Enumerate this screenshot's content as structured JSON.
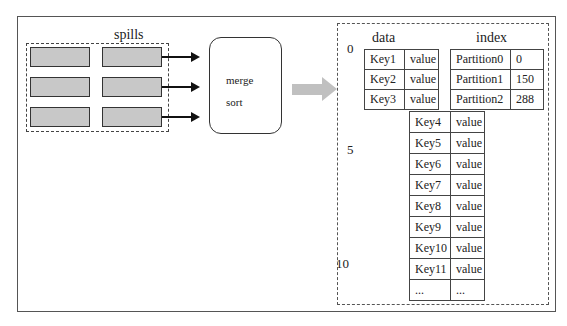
{
  "spills": {
    "label": "spills",
    "blocks": [
      [
        1,
        1
      ],
      [
        1,
        1
      ],
      [
        1,
        1
      ]
    ],
    "colors": {
      "block_fill": "#c8c8c8",
      "block_border": "#333333"
    }
  },
  "merge": {
    "line1": "merge",
    "line2": "sort"
  },
  "output": {
    "row_markers": [
      "0",
      "5",
      "10"
    ],
    "data_label": "data",
    "index_label": "index",
    "data_top": [
      [
        "Key1",
        "value"
      ],
      [
        "Key2",
        "value"
      ],
      [
        "Key3",
        "value"
      ]
    ],
    "index_rows": [
      [
        "Partition0",
        "0"
      ],
      [
        "Partition1",
        "150"
      ],
      [
        "Partition2",
        "288"
      ]
    ],
    "data_bottom": [
      [
        "Key4",
        "value"
      ],
      [
        "Key5",
        "value"
      ],
      [
        "Key6",
        "value"
      ],
      [
        "Key7",
        "value"
      ],
      [
        "Key8",
        "value"
      ],
      [
        "Key9",
        "value"
      ],
      [
        "Key10",
        "value"
      ],
      [
        "Key11",
        "value"
      ],
      [
        "...",
        "..."
      ]
    ]
  },
  "colors": {
    "big_arrow": "#c0c0c0",
    "border": "#444444"
  }
}
